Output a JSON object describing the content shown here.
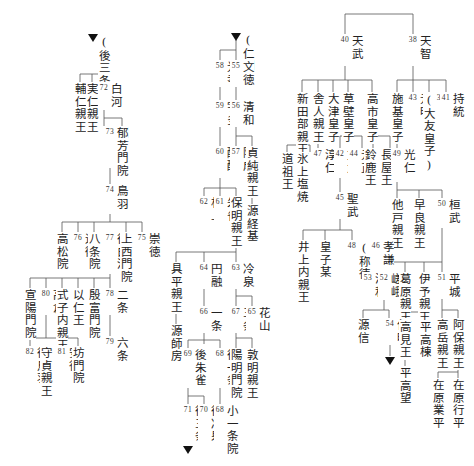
{
  "diagram": {
    "type": "genealogy-tree",
    "line_color": "#555555",
    "text_color": "#222222",
    "nodes": [
      {
        "id": "goSanjoRef",
        "name": "(後三条)",
        "num": ""
      },
      {
        "id": "sukehito",
        "name": "輔仁親王",
        "num": ""
      },
      {
        "id": "sanehito",
        "name": "実仁親王",
        "num": ""
      },
      {
        "id": "shirakawa",
        "name": "白河",
        "num": "72"
      },
      {
        "id": "horikawa",
        "name": "堀河",
        "num": "73"
      },
      {
        "id": "ikuhomonin",
        "name": "郁芳門院",
        "num": ""
      },
      {
        "id": "toba",
        "name": "鳥羽",
        "num": "74"
      },
      {
        "id": "takamatsuin",
        "name": "高松院",
        "num": ""
      },
      {
        "id": "konoe",
        "name": "近衛",
        "num": "76"
      },
      {
        "id": "hachijoin",
        "name": "八条院",
        "num": ""
      },
      {
        "id": "goShirakawa",
        "name": "後白河",
        "num": "77"
      },
      {
        "id": "jozaimonin",
        "name": "上西門院",
        "num": ""
      },
      {
        "id": "sutoku",
        "name": "崇徳",
        "num": "75"
      },
      {
        "id": "senyomonin",
        "name": "宣陽門院",
        "num": ""
      },
      {
        "id": "takakura",
        "name": "高倉",
        "num": "80"
      },
      {
        "id": "shikishi",
        "name": "式子内親王",
        "num": ""
      },
      {
        "id": "mochihito",
        "name": "以仁王",
        "num": ""
      },
      {
        "id": "inpumonin",
        "name": "殷富門院",
        "num": ""
      },
      {
        "id": "nijo",
        "name": "二条",
        "num": "78"
      },
      {
        "id": "rokujo",
        "name": "六条",
        "num": "79"
      },
      {
        "id": "goToba",
        "name": "後鳥羽",
        "num": "82"
      },
      {
        "id": "morisada",
        "name": "守貞親王",
        "num": ""
      },
      {
        "id": "antoku",
        "name": "安徳",
        "num": "81"
      },
      {
        "id": "bomonin",
        "name": "坊門院",
        "num": ""
      },
      {
        "id": "ninmyoRef",
        "name": "(仁明)",
        "num": ""
      },
      {
        "id": "koko",
        "name": "光孝",
        "num": "58"
      },
      {
        "id": "montoku",
        "name": "文徳",
        "num": "55"
      },
      {
        "id": "uda",
        "name": "宇多",
        "num": "59"
      },
      {
        "id": "seiwa",
        "name": "清和",
        "num": "56"
      },
      {
        "id": "daigo",
        "name": "醍醐",
        "num": "60"
      },
      {
        "id": "yozei",
        "name": "陽成",
        "num": "57"
      },
      {
        "id": "sadazumi",
        "name": "貞純親王",
        "num": ""
      },
      {
        "id": "tsunemoto",
        "name": "源経基",
        "num": ""
      },
      {
        "id": "murakami",
        "name": "村上",
        "num": "62"
      },
      {
        "id": "suzaku",
        "name": "朱雀",
        "num": "61"
      },
      {
        "id": "yasuakira",
        "name": "保明親王",
        "num": ""
      },
      {
        "id": "tomohira",
        "name": "具平親王",
        "num": ""
      },
      {
        "id": "morofusa",
        "name": "源師房",
        "num": ""
      },
      {
        "id": "enyu",
        "name": "円融",
        "num": "64"
      },
      {
        "id": "reizei",
        "name": "冷泉",
        "num": "63"
      },
      {
        "id": "ichijo",
        "name": "一条",
        "num": "66"
      },
      {
        "id": "sanjo",
        "name": "三条",
        "num": "67"
      },
      {
        "id": "kazan",
        "name": "花山",
        "num": "65"
      },
      {
        "id": "goSuzaku",
        "name": "後朱雀",
        "num": "69"
      },
      {
        "id": "goIchijo",
        "name": "後一条",
        "num": "68"
      },
      {
        "id": "yomeimonin",
        "name": "陽明門院",
        "num": ""
      },
      {
        "id": "atsuakira",
        "name": "敦明親王",
        "num": ""
      },
      {
        "id": "koichijoin",
        "name": "小一条院",
        "num": "68"
      },
      {
        "id": "goSanjo",
        "name": "後三条",
        "num": "71"
      },
      {
        "id": "goReizei",
        "name": "後冷泉",
        "num": "70"
      },
      {
        "id": "tenmu",
        "name": "天武",
        "num": "40"
      },
      {
        "id": "tenji",
        "name": "天智",
        "num": "38"
      },
      {
        "id": "niitabe",
        "name": "新田部親王",
        "num": ""
      },
      {
        "id": "toneri",
        "name": "舎人親王",
        "num": ""
      },
      {
        "id": "otsu",
        "name": "大津皇子",
        "num": ""
      },
      {
        "id": "kusakabe",
        "name": "草壁皇子",
        "num": ""
      },
      {
        "id": "takechi",
        "name": "高市皇子",
        "num": ""
      },
      {
        "id": "shiki",
        "name": "施基皇子",
        "num": ""
      },
      {
        "id": "genmei",
        "name": "元明",
        "num": "43"
      },
      {
        "id": "kobun",
        "name": "弘文",
        "num": "39",
        "suffix": "(大友皇子)"
      },
      {
        "id": "jito",
        "name": "持統",
        "num": "41"
      },
      {
        "id": "dosoo",
        "name": "道祖王",
        "num": ""
      },
      {
        "id": "higami",
        "name": "氷上塩焼",
        "num": ""
      },
      {
        "id": "junnin",
        "name": "淳仁",
        "num": "47"
      },
      {
        "id": "monmu",
        "name": "文武",
        "num": "42"
      },
      {
        "id": "gensho",
        "name": "元正",
        "num": "44"
      },
      {
        "id": "suzuka",
        "name": "鈴鹿王",
        "num": ""
      },
      {
        "id": "nagaya",
        "name": "長屋王",
        "num": ""
      },
      {
        "id": "konin",
        "name": "光仁",
        "num": "49"
      },
      {
        "id": "shomu",
        "name": "聖武",
        "num": "45"
      },
      {
        "id": "osabe",
        "name": "他戸親王",
        "num": ""
      },
      {
        "id": "sawara",
        "name": "早良親王",
        "num": ""
      },
      {
        "id": "kanmu",
        "name": "桓武",
        "num": "50"
      },
      {
        "id": "inoue",
        "name": "井上内親王",
        "num": ""
      },
      {
        "id": "koshibou",
        "name": "皇子某",
        "num": ""
      },
      {
        "id": "koken",
        "name": "孝謙",
        "num": "46",
        "suffix": "(称徳)",
        "num2": "48"
      },
      {
        "id": "junna",
        "name": "淳和",
        "num": "53"
      },
      {
        "id": "saga",
        "name": "嵯峨",
        "num": "52"
      },
      {
        "id": "kazurahara",
        "name": "葛原親王",
        "num": ""
      },
      {
        "id": "iyo",
        "name": "伊予親王",
        "num": ""
      },
      {
        "id": "heizei",
        "name": "平城",
        "num": "51"
      },
      {
        "id": "minamotoMakoto",
        "name": "源信",
        "num": ""
      },
      {
        "id": "ninmyo",
        "name": "仁明",
        "num": "54"
      },
      {
        "id": "takami",
        "name": "高見王",
        "num": ""
      },
      {
        "id": "taira_takamune",
        "name": "平高棟",
        "num": ""
      },
      {
        "id": "takaoka",
        "name": "高岳親王",
        "num": ""
      },
      {
        "id": "abo",
        "name": "阿保親王",
        "num": ""
      },
      {
        "id": "taira_takamochi",
        "name": "平高望",
        "num": ""
      },
      {
        "id": "narihira",
        "name": "在原業平",
        "num": ""
      },
      {
        "id": "yukihira",
        "name": "在原行平",
        "num": ""
      }
    ]
  },
  "n": {
    "goSanjoRef": "(後三条)",
    "sukehito": "輔仁親王",
    "sanehito": "実仁親王",
    "shirakawa": "白河",
    "shirakawa_n": "72",
    "horikawa": "堀河",
    "horikawa_n": "73",
    "ikuhomonin": "郁芳門院",
    "toba": "鳥羽",
    "toba_n": "74",
    "takamatsuin": "高松院",
    "konoe": "近衛",
    "konoe_n": "76",
    "hachijoin": "八条院",
    "goShirakawa": "後白河",
    "goShirakawa_n": "77",
    "jozaimonin": "上西門院",
    "sutoku": "崇徳",
    "sutoku_n": "75",
    "senyomonin": "宣陽門院",
    "takakura": "高倉",
    "takakura_n": "80",
    "shikishi": "式子内親王",
    "mochihito": "以仁王",
    "inpumonin": "殷富門院",
    "nijo": "二条",
    "nijo_n": "78",
    "rokujo": "六条",
    "rokujo_n": "79",
    "goToba": "後鳥羽",
    "goToba_n": "82",
    "morisada": "守貞親王",
    "antoku": "安徳",
    "antoku_n": "81",
    "bomonin": "坊門院",
    "ninmyoRef": "(仁明)",
    "koko": "光孝",
    "koko_n": "58",
    "montoku": "文徳",
    "montoku_n": "55",
    "uda": "宇多",
    "uda_n": "59",
    "seiwa": "清和",
    "seiwa_n": "56",
    "daigo": "醍醐",
    "daigo_n": "60",
    "yozei": "陽成",
    "yozei_n": "57",
    "sadazumi": "貞純親王",
    "tsunemoto": "源経基",
    "murakami": "村上",
    "murakami_n": "62",
    "suzaku": "朱雀",
    "suzaku_n": "61",
    "yasuakira": "保明親王",
    "tomohira": "具平親王",
    "morofusa": "源師房",
    "enyu": "円融",
    "enyu_n": "64",
    "reizei": "冷泉",
    "reizei_n": "63",
    "ichijo": "一条",
    "ichijo_n": "66",
    "sanjo": "三条",
    "sanjo_n": "67",
    "kazan": "花山",
    "kazan_n": "65",
    "goSuzaku": "後朱雀",
    "goSuzaku_n": "69",
    "goIchijo": "後一条",
    "goIchijo_n": "68",
    "yomeimonin": "陽明門院",
    "atsuakira": "敦明親王",
    "koichijoin": "小一条院",
    "koichijoin_n": "68",
    "goSanjo": "後三条",
    "goSanjo_n": "71",
    "goReizei": "後冷泉",
    "goReizei_n": "70",
    "tenmu": "天武",
    "tenmu_n": "40",
    "tenji": "天智",
    "tenji_n": "38",
    "niitabe": "新田部親王",
    "toneri": "舎人親王",
    "otsu": "大津皇子",
    "kusakabe": "草壁皇子",
    "takechi": "高市皇子",
    "shiki": "施基皇子",
    "genmei": "元明",
    "genmei_n": "43",
    "kobun": "弘文",
    "kobun_n": "39",
    "kobun_s": "(大友皇子)",
    "jito": "持統",
    "jito_n": "41",
    "dosoo": "道祖王",
    "higami": "氷上塩焼",
    "junnin": "淳仁",
    "junnin_n": "47",
    "monmu": "文武",
    "monmu_n": "42",
    "gensho": "元正",
    "gensho_n": "44",
    "suzuka": "鈴鹿王",
    "nagaya": "長屋王",
    "konin": "光仁",
    "konin_n": "49",
    "shomu": "聖武",
    "shomu_n": "45",
    "osabe": "他戸親王",
    "sawara": "早良親王",
    "kanmu": "桓武",
    "kanmu_n": "50",
    "inoue": "井上内親王",
    "koshibou": "皇子某",
    "koken": "孝謙",
    "koken_n": "46",
    "koken_s": "(称徳)",
    "koken_n2": "48",
    "junna": "淳和",
    "junna_n": "53",
    "saga": "嵯峨",
    "saga_n": "52",
    "kazurahara": "葛原親王",
    "iyo": "伊予親王",
    "heizei": "平城",
    "heizei_n": "51",
    "minamotoMakoto": "源信",
    "ninmyo": "仁明",
    "ninmyo_n": "54",
    "takami": "高見王",
    "taira_takamune": "平高棟",
    "takaoka": "高岳親王",
    "abo": "阿保親王",
    "taira_takamochi": "平高望",
    "narihira": "在原業平",
    "yukihira": "在原行平"
  }
}
